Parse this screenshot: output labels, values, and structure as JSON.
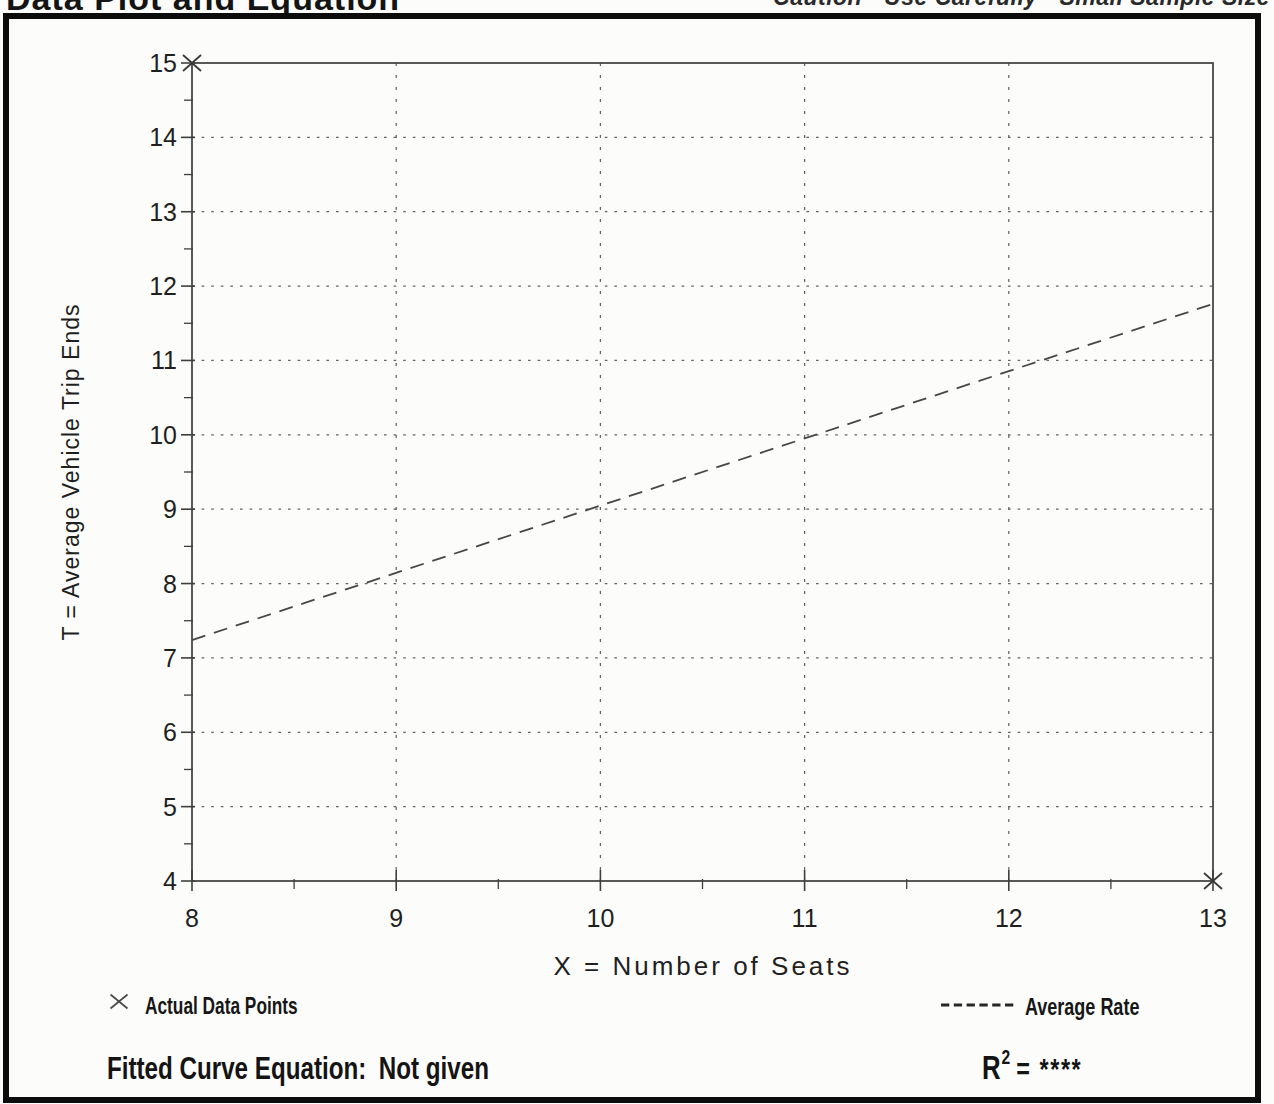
{
  "page": {
    "title": "Data Plot and Equation",
    "caution": "Caution - Use Carefully - Small Sample Size"
  },
  "colors": {
    "ink": "#1a1a1a",
    "paper": "#fcfcfa",
    "grid": "#636363",
    "line": "#474747"
  },
  "chart_data": {
    "type": "scatter",
    "title": "",
    "xlabel": "X = Number of Seats",
    "ylabel": "T = Average Vehicle Trip Ends",
    "xlim": [
      8,
      13
    ],
    "ylim": [
      4,
      15
    ],
    "x_ticks": [
      8,
      9,
      10,
      11,
      12,
      13
    ],
    "y_ticks": [
      4,
      5,
      6,
      7,
      8,
      9,
      10,
      11,
      12,
      13,
      14,
      15
    ],
    "minor_tick_step": 0.5,
    "grid": "dotted",
    "points": [
      [
        8,
        15
      ],
      [
        13,
        4
      ]
    ],
    "average_rate_line": {
      "style": "dashed",
      "x1": 8,
      "y1": 7.24,
      "x2": 13,
      "y2": 11.76
    },
    "legend": [
      {
        "marker": "x",
        "label": "Actual Data Points"
      },
      {
        "marker": "dashed-line",
        "label": "Average Rate"
      }
    ]
  },
  "footer": {
    "fitted_curve_label": "Fitted Curve Equation:",
    "fitted_curve_value": "Not given",
    "r_squared_base": "R",
    "r_squared_sup": "2",
    "r_squared_value": "= ****"
  }
}
